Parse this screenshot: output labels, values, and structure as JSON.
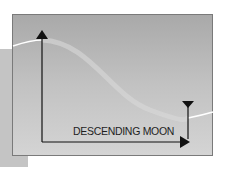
{
  "diagram": {
    "label": "DESCENDING MOON",
    "colors": {
      "panel_top": "#a9a9a9",
      "panel_bottom": "#d4d4d4",
      "border": "#7a7a7a",
      "curve": "#ffffff",
      "axis": "#111111",
      "side_bar": "#c4c4c4"
    },
    "elements": [
      "vertical-arrow-up",
      "horizontal-arrow-right",
      "descending-curve",
      "end-marker-down-triangle"
    ]
  }
}
